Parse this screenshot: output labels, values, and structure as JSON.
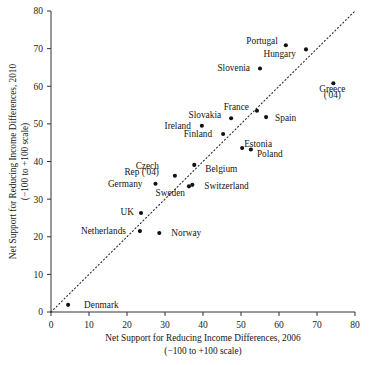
{
  "chart_data": {
    "type": "scatter",
    "title": "",
    "xlabel": "Net Support for Reducing Income Differences, 2006",
    "xlabel_sub": "(−100 to +100 scale)",
    "ylabel": "Net Support for Reducing Income Differences, 2010",
    "ylabel_sub": "(−100 to +100 scale)",
    "xlim": [
      0,
      80
    ],
    "ylim": [
      0,
      80
    ],
    "xticks": [
      0,
      10,
      20,
      30,
      40,
      50,
      60,
      70,
      80
    ],
    "yticks": [
      0,
      10,
      20,
      30,
      40,
      50,
      60,
      70,
      80
    ],
    "grid": false,
    "legend": "none",
    "annotations": [
      {
        "text": "dotted 45-degree reference line (y = x)",
        "kind": "reference-line"
      }
    ],
    "reference_line": {
      "type": "identity",
      "from": [
        0,
        0
      ],
      "to": [
        80,
        80
      ],
      "style": "dotted"
    },
    "points": [
      {
        "label": "Denmark",
        "x": 4.5,
        "y": 1.9,
        "lx": 16,
        "ly": 0,
        "anchor": "start"
      },
      {
        "label": "Netherlands",
        "x": 23.4,
        "y": 21.5,
        "lx": -14,
        "ly": 0.7,
        "anchor": "end"
      },
      {
        "label": "UK",
        "x": 23.7,
        "y": 26.3,
        "lx": -7,
        "ly": 1.1,
        "anchor": "end"
      },
      {
        "label": "Norway",
        "x": 28.5,
        "y": 21.0,
        "lx": 12,
        "ly": 0,
        "anchor": "start"
      },
      {
        "label": "Germany",
        "x": 27.5,
        "y": 34.1,
        "lx": -13,
        "ly": 0.2,
        "anchor": "end"
      },
      {
        "label": "Czech",
        "x": 32.6,
        "y": 36.2,
        "lx": -16,
        "ly": 10.5,
        "anchor": "end"
      },
      {
        "label": "Rep ('04)",
        "x": 32.6,
        "y": 36.2,
        "lx": -16,
        "ly": 3.6,
        "anchor": "end",
        "continuation": true
      },
      {
        "label": "Sweden",
        "x": 36.3,
        "y": 33.4,
        "lx": -4,
        "ly": -6.0,
        "anchor": "end"
      },
      {
        "label": "Switzerland",
        "x": 37.2,
        "y": 33.8,
        "lx": 12,
        "ly": -0.6,
        "anchor": "start"
      },
      {
        "label": "Belgium",
        "x": 37.7,
        "y": 39.1,
        "lx": 11,
        "ly": -3.6,
        "anchor": "start"
      },
      {
        "label": "Ireland",
        "x": 39.7,
        "y": 49.5,
        "lx": -11,
        "ly": 0.2,
        "anchor": "end"
      },
      {
        "label": "Finland",
        "x": 45.3,
        "y": 47.3,
        "lx": -11,
        "ly": 0.3,
        "anchor": "end"
      },
      {
        "label": "Slovakia",
        "x": 47.4,
        "y": 51.5,
        "lx": -10,
        "ly": 3.2,
        "anchor": "end"
      },
      {
        "label": "Estonia",
        "x": 50.3,
        "y": 43.6,
        "lx": 2,
        "ly": 4.0,
        "anchor": "start"
      },
      {
        "label": "Poland",
        "x": 52.6,
        "y": 43.2,
        "lx": 6,
        "ly": -4.2,
        "anchor": "start"
      },
      {
        "label": "France",
        "x": 54.2,
        "y": 53.5,
        "lx": -8,
        "ly": 4.0,
        "anchor": "end"
      },
      {
        "label": "Slovenia",
        "x": 55.0,
        "y": 64.7,
        "lx": -10,
        "ly": 0.3,
        "anchor": "end"
      },
      {
        "label": "Spain",
        "x": 56.6,
        "y": 51.8,
        "lx": 9,
        "ly": -1.0,
        "anchor": "start"
      },
      {
        "label": "Portugal",
        "x": 61.8,
        "y": 70.9,
        "lx": -8,
        "ly": 4.1,
        "anchor": "end"
      },
      {
        "label": "Hungary",
        "x": 67.1,
        "y": 69.8,
        "lx": -10,
        "ly": -4.2,
        "anchor": "end"
      },
      {
        "label": "Greece",
        "x": 74.3,
        "y": 60.8,
        "lx": -1,
        "ly": -5.5,
        "anchor": "middle"
      },
      {
        "label": "('04)",
        "x": 74.3,
        "y": 60.8,
        "lx": -1,
        "ly": -11.5,
        "anchor": "middle",
        "continuation": true
      }
    ]
  },
  "axes": {
    "x_tick_labels": [
      "0",
      "10",
      "20",
      "30",
      "40",
      "50",
      "60",
      "70",
      "80"
    ],
    "y_tick_labels": [
      "0",
      "10",
      "20",
      "30",
      "40",
      "50",
      "60",
      "70",
      "80"
    ]
  }
}
